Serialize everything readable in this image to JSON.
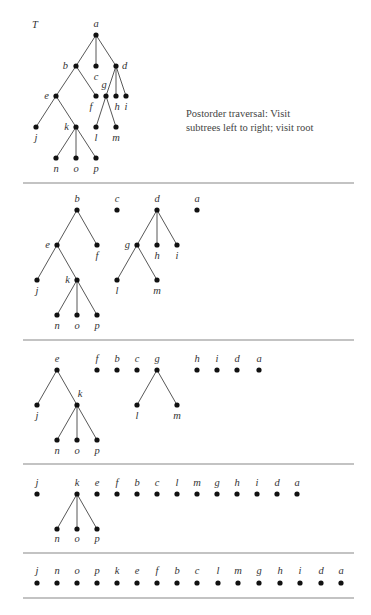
{
  "title": "T",
  "caption": {
    "line1": "Postorder traversal:  Visit",
    "line2": "subtrees left to right; visit root"
  },
  "separators": [
    183,
    340,
    464,
    553,
    598
  ],
  "separator_x": [
    23,
    354
  ],
  "sections": [
    {
      "name": "original-tree",
      "nodes": [
        {
          "id": "a",
          "x": 96,
          "y": 35,
          "lx": 96,
          "ly": 27,
          "anchor": "middle"
        },
        {
          "id": "b",
          "x": 76,
          "y": 66,
          "lx": 68,
          "ly": 69,
          "anchor": "end"
        },
        {
          "id": "c",
          "x": 96,
          "y": 66,
          "lx": 96,
          "ly": 80,
          "anchor": "middle"
        },
        {
          "id": "d",
          "x": 116,
          "y": 66,
          "lx": 122,
          "ly": 69,
          "anchor": "start"
        },
        {
          "id": "e",
          "x": 56,
          "y": 96,
          "lx": 49,
          "ly": 99,
          "anchor": "end"
        },
        {
          "id": "f",
          "x": 96,
          "y": 96,
          "lx": 91,
          "ly": 110,
          "anchor": "middle"
        },
        {
          "id": "g",
          "x": 106,
          "y": 96,
          "lx": 104,
          "ly": 88,
          "anchor": "middle"
        },
        {
          "id": "h",
          "x": 116,
          "y": 96,
          "lx": 117,
          "ly": 110,
          "anchor": "middle"
        },
        {
          "id": "i",
          "x": 126,
          "y": 96,
          "lx": 126,
          "ly": 110,
          "anchor": "middle"
        },
        {
          "id": "j",
          "x": 36,
          "y": 127,
          "lx": 36,
          "ly": 141,
          "anchor": "middle"
        },
        {
          "id": "k",
          "x": 76,
          "y": 127,
          "lx": 69,
          "ly": 130,
          "anchor": "end"
        },
        {
          "id": "l",
          "x": 96,
          "y": 127,
          "lx": 96,
          "ly": 141,
          "anchor": "middle"
        },
        {
          "id": "m",
          "x": 116,
          "y": 127,
          "lx": 116,
          "ly": 141,
          "anchor": "middle"
        },
        {
          "id": "n",
          "x": 56,
          "y": 158,
          "lx": 56,
          "ly": 172,
          "anchor": "middle"
        },
        {
          "id": "o",
          "x": 76,
          "y": 158,
          "lx": 76,
          "ly": 172,
          "anchor": "middle"
        },
        {
          "id": "p",
          "x": 96,
          "y": 158,
          "lx": 96,
          "ly": 172,
          "anchor": "middle"
        }
      ],
      "edges": [
        [
          "a",
          "b"
        ],
        [
          "a",
          "c"
        ],
        [
          "a",
          "d"
        ],
        [
          "b",
          "e"
        ],
        [
          "b",
          "f"
        ],
        [
          "d",
          "g"
        ],
        [
          "d",
          "h"
        ],
        [
          "d",
          "i"
        ],
        [
          "e",
          "j"
        ],
        [
          "e",
          "k"
        ],
        [
          "g",
          "l"
        ],
        [
          "g",
          "m"
        ],
        [
          "k",
          "n"
        ],
        [
          "k",
          "o"
        ],
        [
          "k",
          "p"
        ]
      ]
    },
    {
      "name": "step-1",
      "nodes": [
        {
          "id": "b",
          "x": 77,
          "y": 210,
          "lx": 77,
          "ly": 202,
          "anchor": "middle"
        },
        {
          "id": "c",
          "x": 117,
          "y": 210,
          "lx": 117,
          "ly": 202,
          "anchor": "middle"
        },
        {
          "id": "d",
          "x": 157,
          "y": 210,
          "lx": 157,
          "ly": 202,
          "anchor": "middle"
        },
        {
          "id": "a",
          "x": 197,
          "y": 210,
          "lx": 197,
          "ly": 202,
          "anchor": "middle"
        },
        {
          "id": "e",
          "x": 57,
          "y": 245,
          "lx": 50,
          "ly": 248,
          "anchor": "end"
        },
        {
          "id": "f",
          "x": 97,
          "y": 245,
          "lx": 97,
          "ly": 259,
          "anchor": "middle"
        },
        {
          "id": "g",
          "x": 137,
          "y": 245,
          "lx": 130,
          "ly": 248,
          "anchor": "end"
        },
        {
          "id": "h",
          "x": 157,
          "y": 245,
          "lx": 157,
          "ly": 259,
          "anchor": "middle"
        },
        {
          "id": "i",
          "x": 177,
          "y": 245,
          "lx": 177,
          "ly": 259,
          "anchor": "middle"
        },
        {
          "id": "j",
          "x": 37,
          "y": 280,
          "lx": 37,
          "ly": 294,
          "anchor": "middle"
        },
        {
          "id": "k",
          "x": 77,
          "y": 280,
          "lx": 70,
          "ly": 283,
          "anchor": "end"
        },
        {
          "id": "l",
          "x": 117,
          "y": 280,
          "lx": 117,
          "ly": 294,
          "anchor": "middle"
        },
        {
          "id": "m",
          "x": 157,
          "y": 280,
          "lx": 157,
          "ly": 294,
          "anchor": "middle"
        },
        {
          "id": "n",
          "x": 57,
          "y": 315,
          "lx": 57,
          "ly": 329,
          "anchor": "middle"
        },
        {
          "id": "o",
          "x": 77,
          "y": 315,
          "lx": 77,
          "ly": 329,
          "anchor": "middle"
        },
        {
          "id": "p",
          "x": 97,
          "y": 315,
          "lx": 97,
          "ly": 329,
          "anchor": "middle"
        }
      ],
      "edges": [
        [
          "b",
          "e"
        ],
        [
          "b",
          "f"
        ],
        [
          "d",
          "g"
        ],
        [
          "d",
          "h"
        ],
        [
          "d",
          "i"
        ],
        [
          "e",
          "j"
        ],
        [
          "e",
          "k"
        ],
        [
          "g",
          "l"
        ],
        [
          "g",
          "m"
        ],
        [
          "k",
          "n"
        ],
        [
          "k",
          "o"
        ],
        [
          "k",
          "p"
        ]
      ]
    },
    {
      "name": "step-2",
      "nodes": [
        {
          "id": "e",
          "x": 57,
          "y": 370,
          "lx": 57,
          "ly": 362,
          "anchor": "middle"
        },
        {
          "id": "f",
          "x": 97,
          "y": 370,
          "lx": 97,
          "ly": 362,
          "anchor": "middle"
        },
        {
          "id": "b",
          "x": 117,
          "y": 370,
          "lx": 117,
          "ly": 362,
          "anchor": "middle"
        },
        {
          "id": "c",
          "x": 137,
          "y": 370,
          "lx": 137,
          "ly": 362,
          "anchor": "middle"
        },
        {
          "id": "g",
          "x": 157,
          "y": 370,
          "lx": 157,
          "ly": 362,
          "anchor": "middle"
        },
        {
          "id": "h",
          "x": 197,
          "y": 370,
          "lx": 197,
          "ly": 362,
          "anchor": "middle"
        },
        {
          "id": "i",
          "x": 217,
          "y": 370,
          "lx": 217,
          "ly": 362,
          "anchor": "middle"
        },
        {
          "id": "d",
          "x": 237,
          "y": 370,
          "lx": 237,
          "ly": 362,
          "anchor": "middle"
        },
        {
          "id": "a",
          "x": 259,
          "y": 370,
          "lx": 259,
          "ly": 362,
          "anchor": "middle"
        },
        {
          "id": "j",
          "x": 37,
          "y": 405,
          "lx": 37,
          "ly": 419,
          "anchor": "middle"
        },
        {
          "id": "k",
          "x": 77,
          "y": 405,
          "lx": 80,
          "ly": 397,
          "anchor": "middle"
        },
        {
          "id": "l",
          "x": 137,
          "y": 405,
          "lx": 137,
          "ly": 419,
          "anchor": "middle"
        },
        {
          "id": "m",
          "x": 177,
          "y": 405,
          "lx": 177,
          "ly": 419,
          "anchor": "middle"
        },
        {
          "id": "n",
          "x": 57,
          "y": 440,
          "lx": 57,
          "ly": 454,
          "anchor": "middle"
        },
        {
          "id": "o",
          "x": 77,
          "y": 440,
          "lx": 77,
          "ly": 454,
          "anchor": "middle"
        },
        {
          "id": "p",
          "x": 97,
          "y": 440,
          "lx": 97,
          "ly": 454,
          "anchor": "middle"
        }
      ],
      "edges": [
        [
          "e",
          "j"
        ],
        [
          "e",
          "k"
        ],
        [
          "g",
          "l"
        ],
        [
          "g",
          "m"
        ],
        [
          "k",
          "n"
        ],
        [
          "k",
          "o"
        ],
        [
          "k",
          "p"
        ]
      ]
    },
    {
      "name": "step-3",
      "nodes": [
        {
          "id": "j",
          "x": 37,
          "y": 494,
          "lx": 37,
          "ly": 486,
          "anchor": "middle"
        },
        {
          "id": "k",
          "x": 77,
          "y": 494,
          "lx": 77,
          "ly": 486,
          "anchor": "middle"
        },
        {
          "id": "e",
          "x": 97,
          "y": 494,
          "lx": 97,
          "ly": 486,
          "anchor": "middle"
        },
        {
          "id": "f",
          "x": 117,
          "y": 494,
          "lx": 117,
          "ly": 486,
          "anchor": "middle"
        },
        {
          "id": "b",
          "x": 137,
          "y": 494,
          "lx": 137,
          "ly": 486,
          "anchor": "middle"
        },
        {
          "id": "c",
          "x": 157,
          "y": 494,
          "lx": 157,
          "ly": 486,
          "anchor": "middle"
        },
        {
          "id": "l",
          "x": 177,
          "y": 494,
          "lx": 177,
          "ly": 486,
          "anchor": "middle"
        },
        {
          "id": "m",
          "x": 197,
          "y": 494,
          "lx": 197,
          "ly": 486,
          "anchor": "middle"
        },
        {
          "id": "g",
          "x": 217,
          "y": 494,
          "lx": 217,
          "ly": 486,
          "anchor": "middle"
        },
        {
          "id": "h",
          "x": 237,
          "y": 494,
          "lx": 237,
          "ly": 486,
          "anchor": "middle"
        },
        {
          "id": "i",
          "x": 257,
          "y": 494,
          "lx": 257,
          "ly": 486,
          "anchor": "middle"
        },
        {
          "id": "d",
          "x": 277,
          "y": 494,
          "lx": 277,
          "ly": 486,
          "anchor": "middle"
        },
        {
          "id": "a",
          "x": 297,
          "y": 494,
          "lx": 297,
          "ly": 486,
          "anchor": "middle"
        },
        {
          "id": "n",
          "x": 57,
          "y": 529,
          "lx": 57,
          "ly": 542,
          "anchor": "middle"
        },
        {
          "id": "o",
          "x": 77,
          "y": 529,
          "lx": 77,
          "ly": 542,
          "anchor": "middle"
        },
        {
          "id": "p",
          "x": 97,
          "y": 529,
          "lx": 97,
          "ly": 542,
          "anchor": "middle"
        }
      ],
      "edges": [
        [
          "k",
          "n"
        ],
        [
          "k",
          "o"
        ],
        [
          "k",
          "p"
        ]
      ]
    },
    {
      "name": "final-order",
      "nodes": [
        {
          "id": "j",
          "x": 37,
          "y": 583,
          "lx": 37,
          "ly": 574,
          "anchor": "middle"
        },
        {
          "id": "n",
          "x": 57,
          "y": 583,
          "lx": 57,
          "ly": 574,
          "anchor": "middle"
        },
        {
          "id": "o",
          "x": 77,
          "y": 583,
          "lx": 77,
          "ly": 574,
          "anchor": "middle"
        },
        {
          "id": "p",
          "x": 97,
          "y": 583,
          "lx": 97,
          "ly": 574,
          "anchor": "middle"
        },
        {
          "id": "k",
          "x": 117,
          "y": 583,
          "lx": 117,
          "ly": 574,
          "anchor": "middle"
        },
        {
          "id": "e",
          "x": 137,
          "y": 583,
          "lx": 137,
          "ly": 574,
          "anchor": "middle"
        },
        {
          "id": "f",
          "x": 157,
          "y": 583,
          "lx": 157,
          "ly": 574,
          "anchor": "middle"
        },
        {
          "id": "b",
          "x": 177,
          "y": 583,
          "lx": 177,
          "ly": 574,
          "anchor": "middle"
        },
        {
          "id": "c",
          "x": 197,
          "y": 583,
          "lx": 197,
          "ly": 574,
          "anchor": "middle"
        },
        {
          "id": "l",
          "x": 218,
          "y": 583,
          "lx": 218,
          "ly": 574,
          "anchor": "middle"
        },
        {
          "id": "m",
          "x": 238,
          "y": 583,
          "lx": 238,
          "ly": 574,
          "anchor": "middle"
        },
        {
          "id": "g",
          "x": 259,
          "y": 583,
          "lx": 259,
          "ly": 574,
          "anchor": "middle"
        },
        {
          "id": "h",
          "x": 280,
          "y": 583,
          "lx": 280,
          "ly": 574,
          "anchor": "middle"
        },
        {
          "id": "i",
          "x": 300,
          "y": 583,
          "lx": 300,
          "ly": 574,
          "anchor": "middle"
        },
        {
          "id": "d",
          "x": 321,
          "y": 583,
          "lx": 321,
          "ly": 574,
          "anchor": "middle"
        },
        {
          "id": "a",
          "x": 341,
          "y": 583,
          "lx": 341,
          "ly": 574,
          "anchor": "middle"
        }
      ],
      "edges": []
    }
  ]
}
